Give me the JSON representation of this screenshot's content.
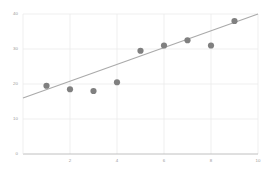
{
  "chart_data": {
    "type": "scatter",
    "title": "",
    "subtitle": "",
    "xlabel": "",
    "ylabel": "",
    "x": [
      1,
      2,
      3,
      4,
      5,
      6,
      7,
      8,
      9
    ],
    "values": [
      19.5,
      18.5,
      18.0,
      20.5,
      29.5,
      31.0,
      32.5,
      31.0,
      38.0
    ],
    "series": [
      {
        "name": "observations",
        "type": "scatter",
        "x": [
          1,
          2,
          3,
          4,
          5,
          6,
          7,
          8,
          9
        ],
        "values": [
          19.5,
          18.5,
          18.0,
          20.5,
          29.5,
          31.0,
          32.5,
          31.0,
          38.0
        ],
        "color": "#808080",
        "marker": "circle",
        "marker_size": 5
      },
      {
        "name": "trend-line",
        "type": "line",
        "x": [
          0.0,
          10.0
        ],
        "values": [
          16.0,
          40.0
        ],
        "color": "#aaaaaa"
      }
    ],
    "xlim": [
      0,
      10
    ],
    "ylim": [
      0,
      40
    ],
    "xticks": [
      2,
      4,
      6,
      8,
      10
    ],
    "xtick_labels": [
      "2",
      "4",
      "6",
      "8",
      "10"
    ],
    "yticks": [
      0,
      10,
      20,
      30,
      40
    ],
    "ytick_labels": [
      "0",
      "10",
      "20",
      "30",
      "40"
    ],
    "grid": true,
    "grid_color": "#e8e8e8",
    "axis_color": "#b0b0b0",
    "legend": null,
    "legend_position": "none",
    "annotations": [],
    "background": "#ffffff",
    "tick_label_color": "#9a9a9a"
  },
  "axes": {
    "y_tick_labels": [
      "40",
      "30",
      "20",
      "10",
      "0"
    ],
    "x_tick_labels": [
      "2",
      "4",
      "6",
      "8",
      "10"
    ]
  }
}
